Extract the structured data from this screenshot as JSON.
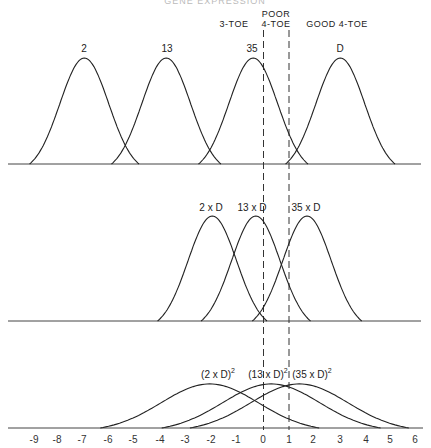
{
  "title_cropped": "GENE EXPRESSION",
  "regions": {
    "three_toe": "3-TOE",
    "poor_line1": "POOR",
    "poor_line2": "4-TOE",
    "good": "GOOD 4-TOE"
  },
  "axis": {
    "xmin": -9,
    "xmax": 6,
    "ticks": [
      "-9",
      "-8",
      "-7",
      "-6",
      "-5",
      "-4",
      "-3",
      "-2",
      "-1",
      "0",
      "1",
      "2",
      "3",
      "4",
      "5",
      "6"
    ],
    "thresholds": [
      0,
      1
    ]
  },
  "chart_data": {
    "type": "line",
    "title": "",
    "xlabel": "",
    "ylabel": "",
    "xlim": [
      -9.5,
      6.3
    ],
    "thresholds": [
      0,
      1
    ],
    "threshold_regions": [
      {
        "label": "3-TOE",
        "range": [
          null,
          0
        ]
      },
      {
        "label": "POOR 4-TOE",
        "range": [
          0,
          1
        ]
      },
      {
        "label": "GOOD 4-TOE",
        "range": [
          1,
          null
        ]
      }
    ],
    "panels": [
      {
        "name": "top",
        "series": [
          {
            "name": "2",
            "mean": -7.0,
            "sd": 0.95,
            "height": 1.0
          },
          {
            "name": "13",
            "mean": -3.8,
            "sd": 0.95,
            "height": 1.0
          },
          {
            "name": "35",
            "mean": -0.4,
            "sd": 0.95,
            "height": 1.0
          },
          {
            "name": "D",
            "mean": 3.0,
            "sd": 0.95,
            "height": 1.0
          }
        ]
      },
      {
        "name": "middle",
        "series": [
          {
            "name": "2 x D",
            "mean": -2.0,
            "sd": 0.95,
            "height": 1.0
          },
          {
            "name": "13 x D",
            "mean": -0.3,
            "sd": 0.95,
            "height": 1.0
          },
          {
            "name": "35 x D",
            "mean": 1.7,
            "sd": 0.95,
            "height": 1.0
          }
        ]
      },
      {
        "name": "bottom",
        "series": [
          {
            "name": "(2 x D)^2",
            "mean": -2.1,
            "sd": 1.9,
            "height": 0.42
          },
          {
            "name": "(13 x D)^2",
            "mean": 0.3,
            "sd": 1.9,
            "height": 0.42
          },
          {
            "name": "(35 x D)^2",
            "mean": 1.4,
            "sd": 1.9,
            "height": 0.42
          }
        ]
      }
    ]
  },
  "labels": {
    "top": [
      "2",
      "13",
      "35",
      "D"
    ],
    "middle": [
      "2 x D",
      "13 x D",
      "35 x D"
    ],
    "bottom": [
      {
        "base": "(2 x D)",
        "sup": "2"
      },
      {
        "base": "(13 x D)",
        "sup": "2"
      },
      {
        "base": "(35 x D)",
        "sup": "2"
      }
    ]
  }
}
